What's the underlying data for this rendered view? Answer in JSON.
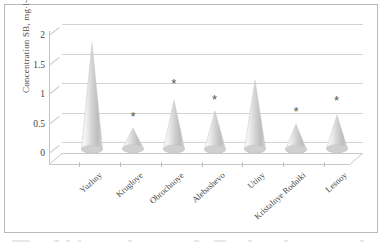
{
  "chart_data": {
    "type": "bar",
    "title": "",
    "xlabel": "",
    "ylabel": "Concentration SB, mg·l-1",
    "ylim": [
      0,
      2
    ],
    "yticks": [
      "0",
      "0.5",
      "1",
      "1.5",
      "2"
    ],
    "ytick_values": [
      0,
      0.5,
      1,
      1.5,
      2
    ],
    "grid": true,
    "legend": "none",
    "bar_style": "cone-3d",
    "categories": [
      "Yuzhny",
      "Krugloye",
      "Obrochnoye",
      "Alebashevo",
      "Utiny",
      "Kristalnye Rodniki",
      "Lesnoy"
    ],
    "values": [
      1.75,
      0.3,
      0.78,
      0.6,
      1.12,
      0.38,
      0.52
    ],
    "annotations": [
      {
        "category": "Krugloye",
        "marker": "*",
        "y": 0.62
      },
      {
        "category": "Obrochnoye",
        "marker": "*",
        "y": 1.18
      },
      {
        "category": "Alebashevo",
        "marker": "*",
        "y": 0.92
      },
      {
        "category": "Kristalnye Rodniki",
        "marker": "*",
        "y": 0.72
      },
      {
        "category": "Lesnoy",
        "marker": "*",
        "y": 0.9
      }
    ],
    "colors": {
      "bar_fill_light": "#f2f2f2",
      "bar_fill_mid": "#d9d9d9",
      "bar_fill_dark": "#b3b3b3",
      "grid": "#d3d3d3",
      "axis": "#c4c4c4",
      "text": "#4a4a4a",
      "marker": "#555555",
      "background": "#ffffff",
      "border": "#b9b9b9"
    }
  }
}
